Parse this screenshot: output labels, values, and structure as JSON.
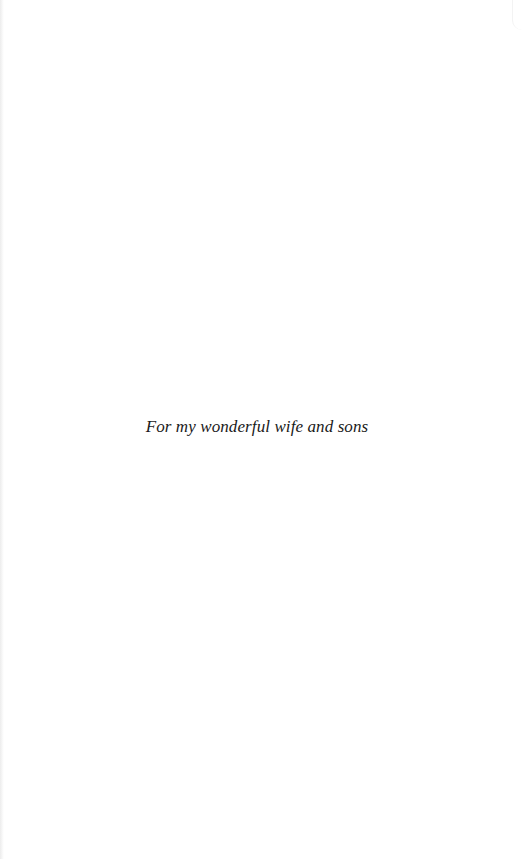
{
  "page": {
    "dedication": "For my wonderful wife and sons"
  }
}
